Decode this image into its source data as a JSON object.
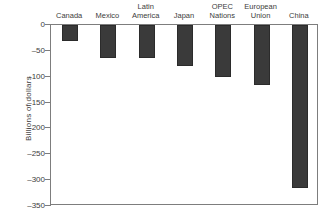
{
  "chart_data": {
    "type": "bar",
    "title": "",
    "xlabel": "",
    "ylabel": "Billions of dollars",
    "categories": [
      "Canada",
      "Mexico",
      "Latin\nAmerica",
      "Japan",
      "OPEC\nNations",
      "European\nUnion",
      "China"
    ],
    "values": [
      -31,
      -63,
      -63,
      -79,
      -100,
      -116,
      -315
    ],
    "ylim": [
      -350,
      0
    ],
    "yticks": [
      0,
      -50,
      -100,
      -150,
      -200,
      -250,
      -300,
      -350
    ],
    "ytick_labels": [
      "0",
      "–50",
      "–100",
      "–150",
      "–200",
      "–250",
      "–300",
      "–350"
    ],
    "grid": false,
    "legend": null,
    "bar_color": "#3a3a3a",
    "axis_color": "#7d7d7d",
    "text_color": "#3c3c3c",
    "xtick_position": "top",
    "orientation": "vertical"
  }
}
